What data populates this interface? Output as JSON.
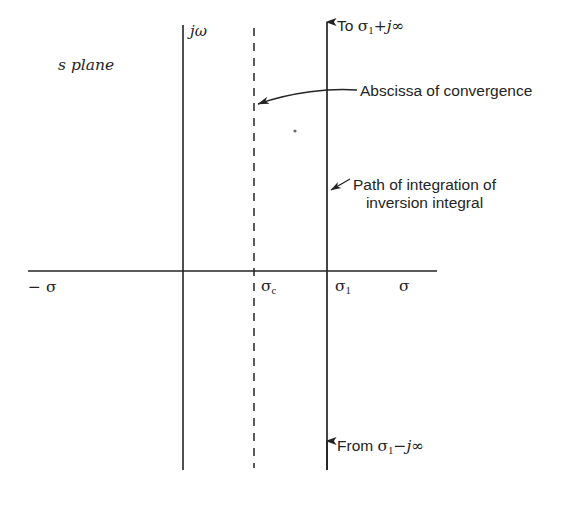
{
  "figure": {
    "background_color": "#ffffff",
    "ink_color": "#242424",
    "plane_label": "s plane",
    "axis_labels": {
      "imaginary_axis": "jω",
      "negative_real": "− σ",
      "real_axis": "σ",
      "abscissa_of_convergence_tick": "σ",
      "abscissa_of_convergence_sub": "c",
      "path_tick": "σ",
      "path_tick_sub": "1"
    },
    "top_endpoint": {
      "prefix": "To",
      "symbol": "σ",
      "subscript": "1",
      "suffix": "+j∞",
      "full_text": "To σ₁+j∞"
    },
    "bottom_endpoint": {
      "prefix": "From",
      "symbol": "σ",
      "subscript": "1",
      "suffix": "−j∞",
      "full_text": "From σ₁−j∞"
    },
    "annotations": [
      {
        "id": "abscissa-of-convergence",
        "text": "Abscissa of convergence",
        "lines": [
          "Abscissa of convergence"
        ],
        "leader": "curved-arrow-left"
      },
      {
        "id": "path-of-integration",
        "text": "Path of integration of inversion integral",
        "lines": [
          "Path of integration of",
          "inversion integral"
        ],
        "leader": "short-arrow-left"
      }
    ],
    "geometry": {
      "imaginary_axis_x": 183,
      "abscissa_dashed_x": 254,
      "integration_path_x": 327,
      "real_axis_y": 271,
      "real_axis_x_start": 28,
      "real_axis_x_end": 437,
      "vertical_top_y": 25,
      "vertical_bottom_y": 470,
      "dash_pattern": "8 7"
    }
  }
}
